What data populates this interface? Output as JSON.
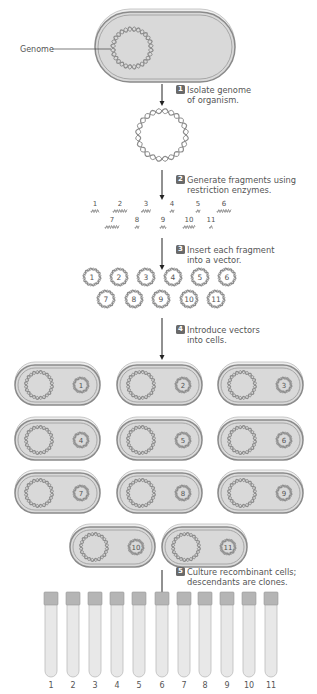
{
  "genome_label": "Genome",
  "steps": [
    {
      "number": "1",
      "line1": "Isolate genome",
      "line2": "of organism."
    },
    {
      "number": "2",
      "line1": "Generate fragments using",
      "line2": "restriction enzymes."
    },
    {
      "number": "3",
      "line1": "Insert each fragment",
      "line2": "into a vector."
    },
    {
      "number": "4",
      "line1": "Introduce vectors",
      "line2": "into cells."
    },
    {
      "number": "5",
      "line1": "Culture recombinant cells;",
      "line2": "descendants are clones."
    }
  ],
  "fragments": [
    "1",
    "2",
    "3",
    "4",
    "5",
    "6",
    "7",
    "8",
    "9",
    "10",
    "11"
  ],
  "vectors": [
    "1",
    "2",
    "3",
    "4",
    "5",
    "6",
    "7",
    "8",
    "9",
    "10",
    "11"
  ],
  "cells": [
    "1",
    "2",
    "3",
    "4",
    "5",
    "6",
    "7",
    "8",
    "9",
    "10",
    "11"
  ],
  "tubes": [
    "1",
    "2",
    "3",
    "4",
    "5",
    "6",
    "7",
    "8",
    "9",
    "10",
    "11"
  ],
  "colors": {
    "badge": "#6a6a6a",
    "cell_fill": "#d9d9d9",
    "cell_outline": "#8a8a8a",
    "dna": "#8c8c8c"
  }
}
